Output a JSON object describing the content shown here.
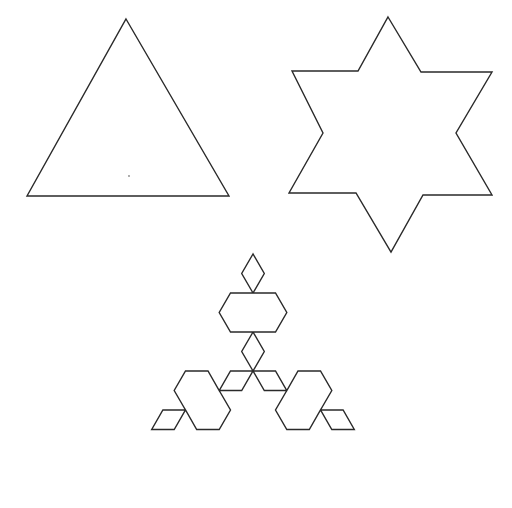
{
  "figure": {
    "stroke_color": "#2a2a2a",
    "background": "#ffffff",
    "shapes": [
      {
        "name": "koch-iteration-0",
        "kind": "triangle",
        "points": [
          [
            126,
            19
          ],
          [
            229,
            196
          ],
          [
            27,
            196
          ]
        ]
      },
      {
        "name": "koch-iteration-1",
        "kind": "six-pointed-star",
        "points": [
          [
            388,
            17
          ],
          [
            421,
            72
          ],
          [
            492,
            72
          ],
          [
            456,
            133
          ],
          [
            492,
            195
          ],
          [
            423,
            195
          ],
          [
            391,
            252
          ],
          [
            356,
            193
          ],
          [
            289,
            193
          ],
          [
            323,
            133
          ],
          [
            292,
            71
          ],
          [
            358,
            71
          ]
        ]
      },
      {
        "name": "koch-iteration-2",
        "kind": "koch-snowflake",
        "level": 2,
        "center": [
          253,
          371
        ],
        "radius": 117
      }
    ],
    "marks": [
      {
        "name": "stray-dot",
        "point": [
          129,
          176
        ]
      }
    ]
  }
}
